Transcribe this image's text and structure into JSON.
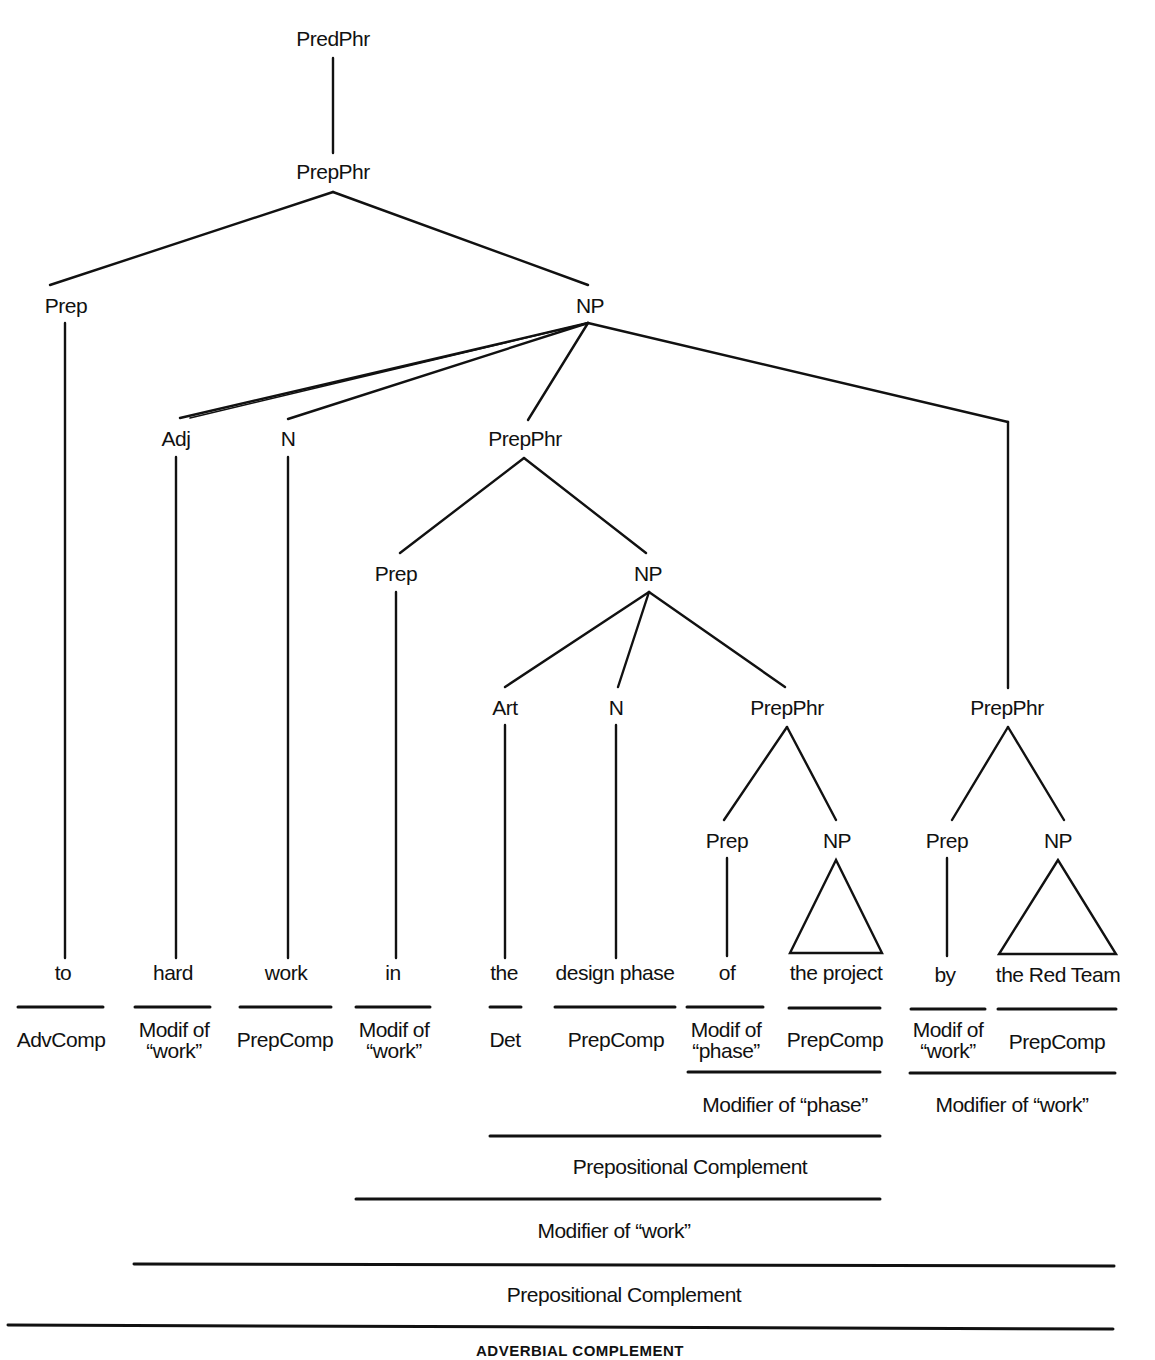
{
  "diagram": {
    "type": "syntax-tree",
    "colors": {
      "ink": "#111111",
      "background": "#ffffff"
    },
    "nodes": {
      "predphr": "PredPhr",
      "prepphr_top": "PrepPhr",
      "prep_1": "Prep",
      "np_1": "NP",
      "adj": "Adj",
      "n_1": "N",
      "prepphr_2": "PrepPhr",
      "prep_2": "Prep",
      "np_2": "NP",
      "art": "Art",
      "n_2": "N",
      "prepphr_3": "PrepPhr",
      "prep_3": "Prep",
      "np_3": "NP",
      "prepphr_4": "PrepPhr",
      "prep_4": "Prep",
      "np_4": "NP"
    },
    "words": [
      "to",
      "hard",
      "work",
      "in",
      "the",
      "design phase",
      "of",
      "the project",
      "by",
      "the Red Team"
    ],
    "functions": [
      "AdvComp",
      "Modif of “work”",
      "PrepComp",
      "Modif of “work”",
      "Det",
      "PrepComp",
      "Modif of “phase”",
      "PrepComp",
      "Modif of “work”",
      "PrepComp"
    ],
    "groupings": {
      "modifier_of_phase": "Modifier of “phase”",
      "modifier_of_work_right": "Modifier of “work”",
      "prepositional_complement_inner": "Prepositional Complement",
      "modifier_of_work_mid": "Modifier of “work”",
      "prepositional_complement_outer": "Prepositional Complement",
      "adverbial_complement": "ADVERBIAL COMPLEMENT"
    }
  }
}
